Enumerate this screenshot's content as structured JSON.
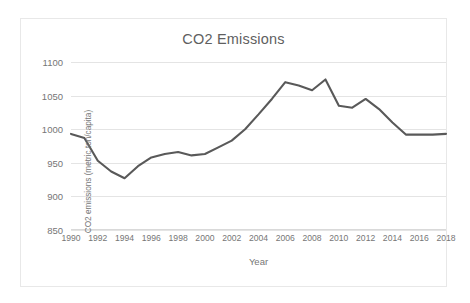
{
  "chart_data": {
    "type": "line",
    "title": "CO2 Emissions",
    "xlabel": "Year",
    "ylabel": "CO2 emissions (metric ton/capita)",
    "xlim": [
      1990,
      2018
    ],
    "ylim": [
      850,
      1100
    ],
    "grid": true,
    "legend": "none",
    "line_color": "#595959",
    "x": [
      1990,
      1991,
      1992,
      1993,
      1994,
      1995,
      1996,
      1997,
      1998,
      1999,
      2000,
      2001,
      2002,
      2003,
      2004,
      2005,
      2006,
      2007,
      2008,
      2009,
      2010,
      2011,
      2012,
      2013,
      2014,
      2015,
      2016,
      2017,
      2018
    ],
    "values": [
      993,
      987,
      953,
      937,
      927,
      945,
      958,
      963,
      966,
      961,
      963,
      973,
      983,
      1000,
      1022,
      1045,
      1070,
      1065,
      1058,
      1074,
      1035,
      1032,
      1045,
      1030,
      1010,
      992,
      992,
      992,
      993
    ],
    "categories": [
      "1990",
      "1991",
      "1992",
      "1993",
      "1994",
      "1995",
      "1996",
      "1997",
      "1998",
      "1999",
      "2000",
      "2001",
      "2002",
      "2003",
      "2004",
      "2005",
      "2006",
      "2007",
      "2008",
      "2009",
      "2010",
      "2011",
      "2012",
      "2013",
      "2014",
      "2015",
      "2016",
      "2017",
      "2018"
    ],
    "yticks": [
      850,
      900,
      950,
      1000,
      1050,
      1100
    ],
    "ytick_labels": [
      "850",
      "900",
      "950",
      "1000",
      "1050",
      "1100"
    ],
    "xticks": [
      1990,
      1992,
      1994,
      1996,
      1998,
      2000,
      2002,
      2004,
      2006,
      2008,
      2010,
      2012,
      2014,
      2016,
      2018
    ],
    "xtick_labels": [
      "1990",
      "1992",
      "1994",
      "1996",
      "1998",
      "2000",
      "2002",
      "2004",
      "2006",
      "2008",
      "2010",
      "2012",
      "2014",
      "2016",
      "2018"
    ],
    "series": [
      {
        "name": "CO2 emissions",
        "values": [
          993,
          987,
          953,
          937,
          927,
          945,
          958,
          963,
          966,
          961,
          963,
          973,
          983,
          1000,
          1022,
          1045,
          1070,
          1065,
          1058,
          1074,
          1035,
          1032,
          1045,
          1030,
          1010,
          992,
          992,
          992,
          993
        ]
      }
    ]
  },
  "colors": {
    "line": "#595959",
    "grid": "#e4e4e4",
    "text": "#767676",
    "title": "#5f5f5f",
    "border": "#e8e8e8",
    "background": "#ffffff"
  }
}
